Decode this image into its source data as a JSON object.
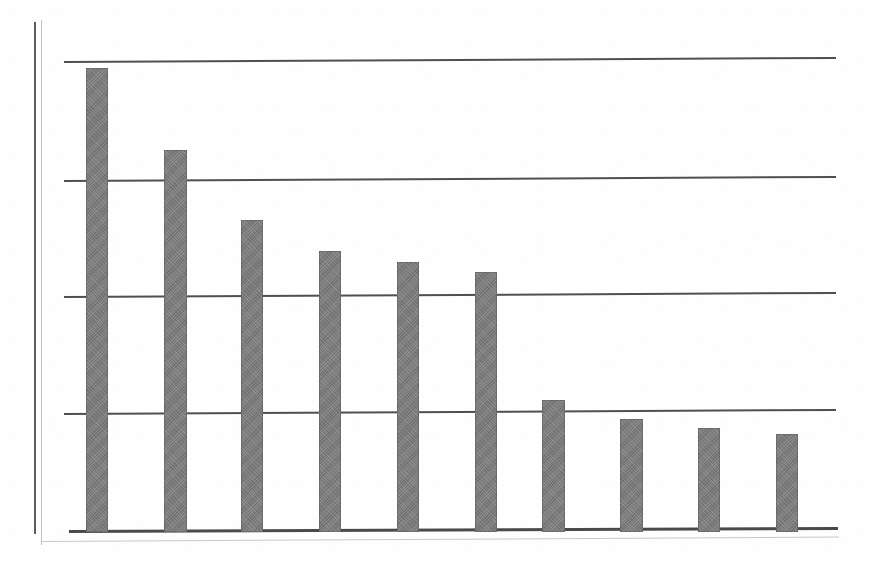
{
  "figure": {
    "name": "scanned-bar-chart",
    "width": 871,
    "height": 578,
    "background_color": "#fefefe"
  },
  "style": {
    "bar_color": "#7b7b7b",
    "axis_color": "#4a4a4a",
    "gridline_color": "#4f4f4f",
    "frame_color": "#c2c2c2"
  },
  "chart_data": {
    "type": "bar",
    "title": "",
    "subtitle": "",
    "xlabel": "",
    "ylabel": "",
    "categories": [
      "1",
      "2",
      "3",
      "4",
      "5",
      "6",
      "7",
      "8",
      "9",
      "10"
    ],
    "values": [
      99,
      81,
      66,
      60,
      57,
      55,
      28,
      24,
      22,
      21
    ],
    "series": [
      {
        "name": "series-1",
        "values": [
          99,
          81,
          66,
          60,
          57,
          55,
          28,
          24,
          22,
          21
        ]
      }
    ],
    "ylim": [
      0,
      100
    ],
    "xlim": [
      0,
      10
    ],
    "yticks": [
      0,
      25,
      50,
      75,
      100
    ],
    "ytick_labels": [
      "",
      "",
      "",
      "",
      ""
    ],
    "xtick_labels": [
      "",
      "",
      "",
      "",
      "",
      "",
      "",
      "",
      "",
      ""
    ],
    "grid": true,
    "grid_axis": "y",
    "legend": false,
    "legend_position": "none",
    "annotations": [],
    "bar_count": 10,
    "bar_orientation": "vertical",
    "sorted": "descending"
  },
  "gridlines": [
    {
      "name": "gridline-100",
      "value": 100,
      "top": 61
    },
    {
      "name": "gridline-75",
      "value": 75,
      "top": 180
    },
    {
      "name": "gridline-50",
      "value": 50,
      "top": 296
    },
    {
      "name": "gridline-25",
      "value": 25,
      "top": 413
    }
  ],
  "bars": [
    {
      "name": "bar-1",
      "value": 99,
      "left": 86,
      "top": 68,
      "width": 22,
      "height": 464
    },
    {
      "name": "bar-2",
      "value": 81,
      "left": 164,
      "top": 150,
      "width": 23,
      "height": 382
    },
    {
      "name": "bar-3",
      "value": 66,
      "left": 241,
      "top": 220,
      "width": 22,
      "height": 312
    },
    {
      "name": "bar-4",
      "value": 60,
      "left": 319,
      "top": 251,
      "width": 22,
      "height": 281
    },
    {
      "name": "bar-5",
      "value": 57,
      "left": 397,
      "top": 262,
      "width": 22,
      "height": 270
    },
    {
      "name": "bar-6",
      "value": 55,
      "left": 475,
      "top": 272,
      "width": 22,
      "height": 260
    },
    {
      "name": "bar-7",
      "value": 28,
      "left": 542,
      "top": 400,
      "width": 23,
      "height": 132
    },
    {
      "name": "bar-8",
      "value": 24,
      "left": 620,
      "top": 419,
      "width": 23,
      "height": 113
    },
    {
      "name": "bar-9",
      "value": 22,
      "left": 698,
      "top": 428,
      "width": 22,
      "height": 104
    },
    {
      "name": "bar-10",
      "value": 21,
      "left": 776,
      "top": 434,
      "width": 22,
      "height": 98
    }
  ]
}
